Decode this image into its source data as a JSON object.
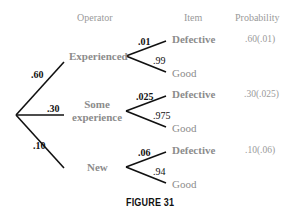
{
  "headers": {
    "operator": "Operator",
    "item": "Item",
    "probability": "Probability"
  },
  "operators": [
    {
      "label": "Experienced",
      "branch_prob": ".60"
    },
    {
      "label_line1": "Some",
      "label_line2": "experience",
      "branch_prob": ".30"
    },
    {
      "label": "New",
      "branch_prob": ".10"
    }
  ],
  "items": [
    {
      "defective_label": "Defective",
      "defective_prob": ".01",
      "good_label": "Good",
      "good_prob": ".99",
      "result": ".60(.01)"
    },
    {
      "defective_label": "Defective",
      "defective_prob": ".025",
      "good_label": "Good",
      "good_prob": ".975",
      "result": ".30(.025)"
    },
    {
      "defective_label": "Defective",
      "defective_prob": ".06",
      "good_label": "Good",
      "good_prob": ".94",
      "result": ".10(.06)"
    }
  ],
  "caption": "FIGURE 31",
  "colors": {
    "line": "#111111",
    "label_gray": "#8c8c8c",
    "number_black": "#111111"
  }
}
